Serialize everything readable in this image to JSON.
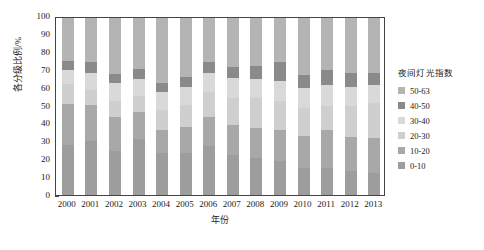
{
  "chart_data": {
    "type": "bar",
    "stacked": true,
    "stacked_normalized": true,
    "title": "",
    "xlabel": "年份",
    "ylabel": "各分级比例/%",
    "ylim": [
      0,
      100
    ],
    "yticks": [
      0,
      10,
      20,
      30,
      40,
      50,
      60,
      70,
      80,
      90,
      100
    ],
    "grid": false,
    "legend_position": "right",
    "legend_title": "夜间灯光指数",
    "categories": [
      "2000",
      "2001",
      "2002",
      "2003",
      "2004",
      "2005",
      "2006",
      "2007",
      "2008",
      "2009",
      "2010",
      "2011",
      "2012",
      "2013"
    ],
    "series": [
      {
        "name": "0-10",
        "color": "#9d9d9d",
        "values": [
          28.5,
          30.5,
          25.0,
          31.5,
          23.5,
          24.0,
          27.5,
          22.5,
          21.0,
          19.0,
          15.5,
          15.0,
          13.5,
          12.5
        ]
      },
      {
        "name": "10-20",
        "color": "#a8a8a8",
        "values": [
          23.0,
          20.5,
          19.0,
          15.5,
          13.0,
          14.5,
          16.5,
          17.0,
          17.0,
          17.5,
          18.0,
          21.5,
          19.0,
          19.5
        ]
      },
      {
        "name": "20-30",
        "color": "#cfcfcf",
        "values": [
          11.0,
          8.5,
          9.0,
          9.0,
          11.5,
          12.5,
          14.0,
          15.5,
          17.0,
          16.5,
          15.5,
          14.0,
          18.0,
          20.0
        ]
      },
      {
        "name": "30-40",
        "color": "#d9d9d9",
        "values": [
          8.0,
          9.5,
          10.5,
          9.5,
          10.0,
          10.0,
          11.0,
          11.0,
          10.5,
          11.5,
          11.5,
          11.5,
          10.5,
          10.0
        ]
      },
      {
        "name": "40-50",
        "color": "#8a8a8a",
        "values": [
          5.5,
          6.0,
          5.0,
          5.5,
          5.5,
          5.5,
          6.0,
          6.5,
          7.5,
          10.5,
          7.5,
          8.5,
          8.0,
          7.0
        ]
      },
      {
        "name": "50-63",
        "color": "#b4b4b4",
        "values": [
          24.0,
          25.0,
          31.5,
          29.0,
          36.5,
          33.5,
          25.0,
          27.5,
          27.0,
          25.0,
          32.0,
          29.5,
          31.0,
          31.0
        ]
      }
    ]
  },
  "legend": {
    "title": "夜间灯光指数",
    "items": [
      {
        "label": "50-63",
        "color": "#b4b4b4"
      },
      {
        "label": "40-50",
        "color": "#8a8a8a"
      },
      {
        "label": "30-40",
        "color": "#d9d9d9"
      },
      {
        "label": "20-30",
        "color": "#cfcfcf"
      },
      {
        "label": "10-20",
        "color": "#a8a8a8"
      },
      {
        "label": "0-10",
        "color": "#9d9d9d"
      }
    ]
  }
}
